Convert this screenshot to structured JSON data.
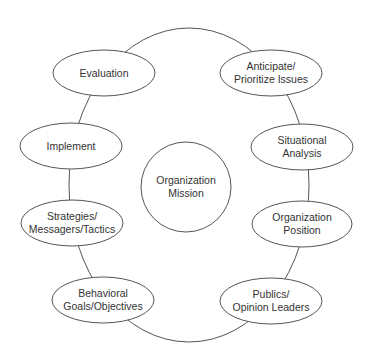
{
  "diagram": {
    "center": {
      "lines": [
        "Organization",
        "Mission"
      ]
    },
    "nodes": [
      {
        "id": "evaluation",
        "lines": [
          "Evaluation"
        ]
      },
      {
        "id": "anticipate",
        "lines": [
          "Anticipate/",
          "Prioritize Issues"
        ]
      },
      {
        "id": "situational",
        "lines": [
          "Situational",
          "Analysis"
        ]
      },
      {
        "id": "position",
        "lines": [
          "Organization",
          "Position"
        ]
      },
      {
        "id": "publics",
        "lines": [
          "Publics/",
          "Opinion Leaders"
        ]
      },
      {
        "id": "behavioral",
        "lines": [
          "Behavioral",
          "Goals/Objectives"
        ]
      },
      {
        "id": "strategies",
        "lines": [
          "Strategies/",
          "Messagers/Tactics"
        ]
      },
      {
        "id": "implement",
        "lines": [
          "Implement"
        ]
      }
    ],
    "colors": {
      "stroke": "#555555",
      "text": "#333333",
      "fill": "#ffffff"
    }
  }
}
